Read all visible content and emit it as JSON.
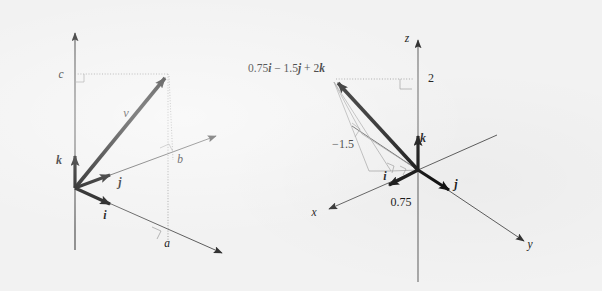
{
  "figure": {
    "background_color": "#f2f2f2",
    "ink_color": "#141414",
    "guide_color": "#9a9a9a"
  },
  "left_panel": {
    "name": "general-vector-components",
    "description": "A vector v resolved into components a, b, c along the i, j, k directions",
    "labels": {
      "vector": "v",
      "unit_i": "i",
      "unit_j": "j",
      "unit_k": "k",
      "component_a": "a",
      "component_b": "b",
      "component_c": "c"
    }
  },
  "right_panel": {
    "name": "specific-vector-example",
    "description": "The vector 0.75i - 1.5j + 2k drawn on labelled x, y, z axes",
    "formula": {
      "full": "0.75i − 1.5j + 2k",
      "part_1_coefficient": "0.75",
      "part_1_unit": "i",
      "operator_1": "−",
      "part_2_coefficient": "1.5",
      "part_2_unit": "j",
      "operator_2": "+",
      "part_3_coefficient": "2",
      "part_3_unit": "k"
    },
    "labels": {
      "axis_x": "x",
      "axis_y": "y",
      "axis_z": "z",
      "unit_i": "i",
      "unit_j": "j",
      "unit_k": "k",
      "value_x": "0.75",
      "value_y": "−1.5",
      "value_z": "2"
    }
  }
}
